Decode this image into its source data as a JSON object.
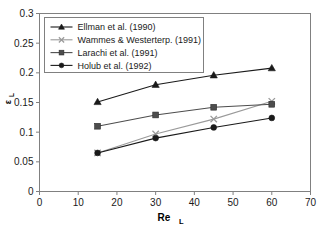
{
  "chart_data": {
    "type": "line",
    "title": "",
    "xlabel": "Re_L",
    "xlabel_main": "Re",
    "xlabel_sub": "L",
    "ylabel": "ε_L",
    "ylabel_main": "ε",
    "ylabel_sub": "L",
    "x": [
      15,
      30,
      45,
      60
    ],
    "xlim": [
      0,
      70
    ],
    "ylim": [
      0,
      0.3
    ],
    "xticks": [
      0,
      10,
      20,
      30,
      40,
      50,
      60,
      70
    ],
    "xtick_labels": [
      "0",
      "10",
      "20",
      "30",
      "40",
      "50",
      "60",
      "70"
    ],
    "yticks": [
      0,
      0.05,
      0.1,
      0.15,
      0.2,
      0.25,
      0.3
    ],
    "ytick_labels": [
      "0",
      "0.05",
      "0.1",
      "0.15",
      "0.2",
      "0.25",
      "0.3"
    ],
    "grid": false,
    "legend_position": "upper-left",
    "series": [
      {
        "name": "Ellman et al. (1990)",
        "marker": "triangle",
        "color": "#1a1a1a",
        "x": [
          15,
          30,
          45,
          60
        ],
        "values": [
          0.151,
          0.18,
          0.196,
          0.208
        ]
      },
      {
        "name": "Wammes & Westerterp. (1991)",
        "marker": "x",
        "color": "#9a9a9a",
        "x": [
          15,
          30,
          45,
          60
        ],
        "values": [
          0.065,
          0.097,
          0.122,
          0.152
        ]
      },
      {
        "name": "Larachi et al. (1991)",
        "marker": "square",
        "color": "#4d4d4d",
        "x": [
          15,
          30,
          45,
          60
        ],
        "values": [
          0.11,
          0.129,
          0.142,
          0.147
        ]
      },
      {
        "name": "Holub et al. (1992)",
        "marker": "circle",
        "color": "#1a1a1a",
        "x": [
          15,
          30,
          45,
          60
        ],
        "values": [
          0.065,
          0.09,
          0.108,
          0.124
        ]
      }
    ]
  },
  "legend": {
    "entries": [
      "Ellman et al. (1990)",
      "Wammes & Westerterp. (1991)",
      "Larachi et al. (1991)",
      "Holub et al. (1992)"
    ]
  },
  "colors": {
    "frame": "#808080",
    "text": "#1a1a1a",
    "background": "#ffffff"
  }
}
